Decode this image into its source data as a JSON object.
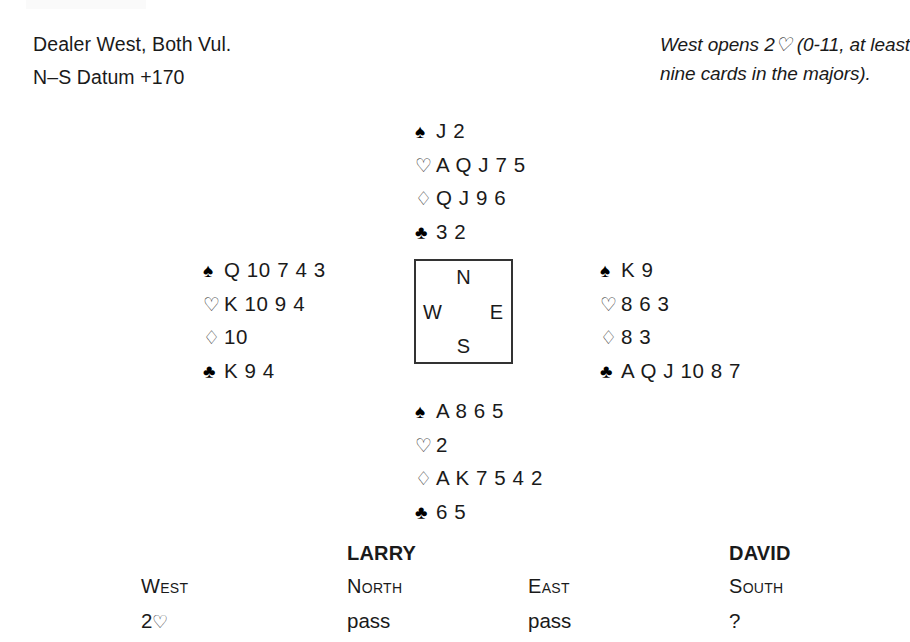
{
  "header": {
    "dealer_line": "Dealer West, Both Vul.",
    "datum_line": "N–S Datum +170",
    "auction_note": "West opens 2♡ (0-11, at least nine cards in the majors)."
  },
  "compass": {
    "north": "N",
    "south": "S",
    "west": "W",
    "east": "E"
  },
  "suit_symbols": {
    "spade": "♠",
    "heart": "♡",
    "diamond": "♢",
    "club": "♣"
  },
  "hands": {
    "north": {
      "seat": "North",
      "spades": "J 2",
      "hearts": "A Q J 7 5",
      "diamonds": "Q J 9 6",
      "clubs": "3 2"
    },
    "west": {
      "seat": "West",
      "spades": "Q 10 7 4 3",
      "hearts": "K 10 9 4",
      "diamonds": "10",
      "clubs": "K 9 4"
    },
    "east": {
      "seat": "East",
      "spades": "K 9",
      "hearts": "8 6 3",
      "diamonds": "8 3",
      "clubs": "A Q J 10 8 7"
    },
    "south": {
      "seat": "South",
      "spades": "A 8 6 5",
      "hearts": "2",
      "diamonds": "A K 7 5 4 2",
      "clubs": "6 5"
    }
  },
  "auction": {
    "columns": [
      {
        "player": "",
        "seat": "West",
        "bid": "2",
        "bid_suit": "♡"
      },
      {
        "player": "LARRY",
        "seat": "North",
        "bid": "pass",
        "bid_suit": ""
      },
      {
        "player": "",
        "seat": "East",
        "bid": "pass",
        "bid_suit": ""
      },
      {
        "player": "DAVID",
        "seat": "South",
        "bid": "?",
        "bid_suit": ""
      }
    ]
  },
  "colors": {
    "text": "#1a1a1a",
    "suit_solid": "#000000",
    "suit_hollow": "#444444",
    "compass_border": "#333333",
    "background": "#ffffff"
  }
}
